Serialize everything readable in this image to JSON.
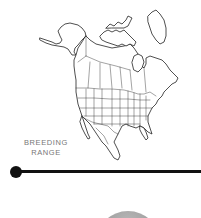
{
  "figure": {
    "type": "range-map",
    "region": "North America",
    "map_icon": "north-america-outline-map"
  },
  "legend": {
    "line1": "BREEDING",
    "line2": "RANGE"
  },
  "divider": {
    "icon": "timeline-dot",
    "color": "#111111"
  },
  "bottom_element": {
    "icon": "gray-circle",
    "color": "#a6a6a6"
  },
  "colors": {
    "background": "#ffffff",
    "outline": "#222222",
    "label": "#777777"
  }
}
